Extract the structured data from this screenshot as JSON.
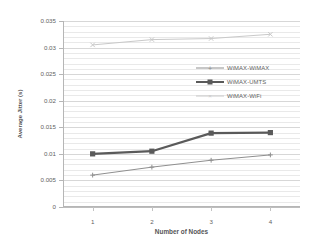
{
  "chart_data": {
    "type": "line",
    "title": "",
    "xlabel": "Number of Nodes",
    "ylabel": "Average Jitter (s)",
    "categories": [
      "1",
      "2",
      "3",
      "4"
    ],
    "x": [
      1,
      2,
      3,
      4
    ],
    "xlim": [
      0.5,
      4.5
    ],
    "ylim": [
      0,
      0.035
    ],
    "ytick_labels": [
      "0",
      "0.005",
      "0.01",
      "0.015",
      "0.02",
      "0.025",
      "0.03",
      "0.035"
    ],
    "ytick_values": [
      0,
      0.005,
      0.01,
      0.015,
      0.02,
      0.025,
      0.03,
      0.035
    ],
    "grid": "horizontal-minor-and-major",
    "minor_gridline_step": 0.001,
    "legend_position": "center-right-inside",
    "series": [
      {
        "name": "WiMAX-WiMAX",
        "values": [
          0.006,
          0.0075,
          0.0088,
          0.0098
        ],
        "color": "#8f8f8f",
        "marker": "plus",
        "line_width": 1
      },
      {
        "name": "WiMAX-UMTS",
        "values": [
          0.01,
          0.0105,
          0.0139,
          0.014
        ],
        "color": "#5a5a5a",
        "marker": "square",
        "line_width": 2.2
      },
      {
        "name": "WiMAX-WiFi",
        "values": [
          0.0305,
          0.0315,
          0.0317,
          0.0325
        ],
        "color": "#c9c9c9",
        "marker": "x",
        "line_width": 1
      }
    ]
  },
  "axes": {
    "y_title": "Average Jitter (s)",
    "x_title": "Number of Nodes"
  },
  "legend": {
    "items": [
      {
        "label": "WiMAX-WiMAX",
        "marker": "plus-marker"
      },
      {
        "label": "WiMAX-UMTS",
        "marker": "square-marker"
      },
      {
        "label": "WiMAX-WiFi",
        "marker": "x-marker"
      }
    ]
  },
  "colors": {
    "series_wimax_wimax": "#8f8f8f",
    "series_wimax_umts": "#5a5a5a",
    "series_wimax_wifi": "#c9c9c9",
    "gridline_minor": "#e9e9e9",
    "gridline_major": "#d7d7d7",
    "axis": "#b6b6b6",
    "text": "#5f5f5f",
    "background": "#ffffff"
  },
  "caption": {
    "text": ""
  }
}
